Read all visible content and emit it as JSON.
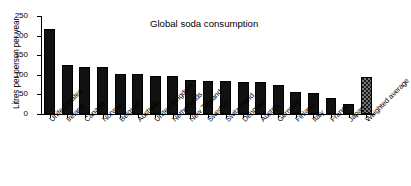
{
  "chart_data": {
    "type": "bar",
    "title": "Global soda consumption",
    "xlabel": "",
    "ylabel": "Litres per person per year",
    "ylim": [
      0,
      250
    ],
    "yticks": [
      0,
      50,
      100,
      150,
      200,
      250
    ],
    "grid": false,
    "legend": "none",
    "categories": [
      "United States",
      "Ireland",
      "Canada",
      "Norway",
      "Belgium",
      "Australia",
      "United Kingdom",
      "Netherlands",
      "New Zealand",
      "Sweden",
      "Switzerland",
      "Denmark",
      "Austria",
      "Germany",
      "Finland",
      "Italy",
      "France",
      "Japan",
      "Weighted average"
    ],
    "values": [
      216,
      125,
      120,
      120,
      103,
      101,
      98,
      97,
      86,
      85,
      84,
      82,
      81,
      75,
      55,
      53,
      41,
      26,
      95
    ],
    "highlight_index": 18,
    "bar_color": "#111111",
    "highlight_pattern": "cross-hatch"
  }
}
